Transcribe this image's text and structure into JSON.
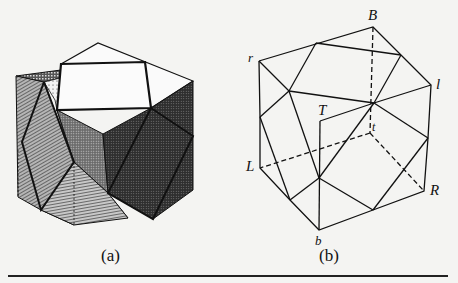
{
  "figures": [
    {
      "id": "a",
      "caption": "(a)",
      "description": "Shaded 3D cube decomposition with hatched, dotted, and dark stippled faces"
    },
    {
      "id": "b",
      "caption": "(b)",
      "description": "Wireframe cube with vertex labels and dashed hidden edges",
      "vertex_labels": {
        "B": "B",
        "r": "r",
        "l": "l",
        "T": "T",
        "t": "t",
        "L": "L",
        "R": "R",
        "b": "b"
      }
    }
  ],
  "colors": {
    "background": "#f4f4f2",
    "line": "#111111",
    "dark_fill": "#3a3a3a",
    "hatch_fill": "#8a8a8a",
    "light_fill": "#cfcfcf"
  }
}
